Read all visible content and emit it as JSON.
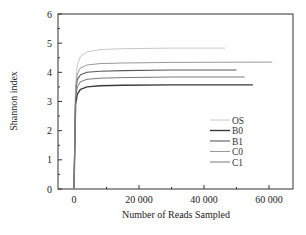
{
  "chart_data": {
    "type": "line",
    "title": "",
    "xlabel": "Number of Reads Sampled",
    "ylabel": "Shannon index",
    "xlim": [
      -5000,
      67000
    ],
    "ylim": [
      0,
      6
    ],
    "x_ticks": [
      0,
      20000,
      40000,
      60000
    ],
    "x_tick_labels": [
      "0",
      "20 000",
      "40 000",
      "60 000"
    ],
    "y_ticks": [
      0,
      1,
      2,
      3,
      4,
      5,
      6
    ],
    "y_tick_labels": [
      "0",
      "1",
      "2",
      "3",
      "4",
      "5",
      "6"
    ],
    "grid": false,
    "legend_position": "lower right (inside)",
    "series": [
      {
        "name": "OS",
        "color": "#c8c8c8",
        "width": 1.0,
        "plateau": 4.83,
        "max_reads": 46500,
        "x": [
          0,
          500,
          1000,
          2000,
          4000,
          8000,
          15000,
          30000,
          46500
        ],
        "y": [
          0,
          3.6,
          4.25,
          4.55,
          4.7,
          4.78,
          4.81,
          4.83,
          4.83
        ]
      },
      {
        "name": "B0",
        "color": "#3a3a3a",
        "width": 1.4,
        "plateau": 3.57,
        "max_reads": 55000,
        "x": [
          0,
          500,
          1000,
          2000,
          4000,
          8000,
          15000,
          30000,
          55000
        ],
        "y": [
          0,
          2.9,
          3.25,
          3.42,
          3.5,
          3.54,
          3.56,
          3.57,
          3.57
        ]
      },
      {
        "name": "B1",
        "color": "#5a5a5a",
        "width": 1.1,
        "plateau": 4.08,
        "max_reads": 50000,
        "x": [
          0,
          500,
          1000,
          2000,
          4000,
          8000,
          15000,
          30000,
          50000
        ],
        "y": [
          0,
          3.3,
          3.75,
          3.92,
          4.0,
          4.04,
          4.06,
          4.08,
          4.08
        ]
      },
      {
        "name": "C0",
        "color": "#9a9a9a",
        "width": 1.0,
        "plateau": 4.35,
        "max_reads": 61000,
        "x": [
          0,
          500,
          1000,
          2000,
          4000,
          8000,
          15000,
          30000,
          61000
        ],
        "y": [
          0,
          3.4,
          3.95,
          4.15,
          4.25,
          4.3,
          4.32,
          4.34,
          4.35
        ]
      },
      {
        "name": "C1",
        "color": "#7a7a7a",
        "width": 1.0,
        "plateau": 3.84,
        "max_reads": 52500,
        "x": [
          0,
          500,
          1000,
          2000,
          4000,
          8000,
          15000,
          30000,
          52500
        ],
        "y": [
          0,
          3.1,
          3.5,
          3.68,
          3.76,
          3.8,
          3.82,
          3.84,
          3.84
        ]
      }
    ]
  }
}
